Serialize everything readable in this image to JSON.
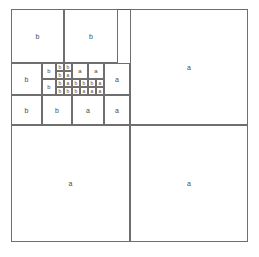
{
  "figure": {
    "background_color": "#ffffff",
    "line_color": "#6f6f6f",
    "outer_line_color": "#5a5a5a",
    "label_color": "#4a4a4a",
    "canvas": {
      "width": 259,
      "height": 257
    }
  },
  "outer_frame": {
    "x": 11,
    "y": 9,
    "width": 237,
    "height": 233
  },
  "labels": {
    "a": "a",
    "b": "b"
  },
  "cells": [
    {
      "name": "top-left-b-1",
      "label": "b",
      "x": 11,
      "y": 9,
      "w": 53,
      "h": 54,
      "font": 7
    },
    {
      "name": "top-left-b-2",
      "label": "b",
      "x": 64,
      "y": 9,
      "w": 54,
      "h": 54,
      "font": 7
    },
    {
      "name": "top-right-a-large",
      "label": "a",
      "x": 130,
      "y": 9,
      "w": 118,
      "h": 116,
      "font": 7
    },
    {
      "name": "mid-left-b",
      "label": "b",
      "x": 11,
      "y": 63,
      "w": 31,
      "h": 32,
      "font": 7
    },
    {
      "name": "mid-b-upper",
      "label": "b",
      "x": 42,
      "y": 63,
      "w": 14,
      "h": 16,
      "font": 6
    },
    {
      "name": "mid-b-lower",
      "label": "b",
      "x": 42,
      "y": 79,
      "w": 14,
      "h": 16,
      "font": 6
    },
    {
      "name": "core-r1-b-1",
      "label": "b",
      "x": 56,
      "y": 63,
      "w": 8,
      "h": 8,
      "font": 5
    },
    {
      "name": "core-r1-b-2",
      "label": "b",
      "x": 64,
      "y": 63,
      "w": 8,
      "h": 8,
      "font": 5
    },
    {
      "name": "core-r2-b-1",
      "label": "b",
      "x": 56,
      "y": 71,
      "w": 8,
      "h": 8,
      "font": 5
    },
    {
      "name": "core-r2-a-1",
      "label": "a",
      "x": 64,
      "y": 71,
      "w": 8,
      "h": 8,
      "font": 5
    },
    {
      "name": "core-top-a-1",
      "label": "a",
      "x": 72,
      "y": 63,
      "w": 16,
      "h": 16,
      "font": 6
    },
    {
      "name": "core-top-a-2",
      "label": "a",
      "x": 88,
      "y": 63,
      "w": 16,
      "h": 16,
      "font": 6
    },
    {
      "name": "core-r3-b-1",
      "label": "b",
      "x": 56,
      "y": 79,
      "w": 8,
      "h": 8,
      "font": 5
    },
    {
      "name": "core-r3-a-1",
      "label": "a",
      "x": 64,
      "y": 79,
      "w": 8,
      "h": 8,
      "font": 5
    },
    {
      "name": "core-r3-b-2",
      "label": "b",
      "x": 72,
      "y": 79,
      "w": 8,
      "h": 8,
      "font": 5
    },
    {
      "name": "core-r3-b-3",
      "label": "b",
      "x": 80,
      "y": 79,
      "w": 8,
      "h": 8,
      "font": 5
    },
    {
      "name": "core-r3-b-4",
      "label": "b",
      "x": 88,
      "y": 79,
      "w": 8,
      "h": 8,
      "font": 5
    },
    {
      "name": "core-r3-a-2",
      "label": "a",
      "x": 96,
      "y": 79,
      "w": 8,
      "h": 8,
      "font": 5
    },
    {
      "name": "core-r4-b-1",
      "label": "b",
      "x": 56,
      "y": 87,
      "w": 8,
      "h": 8,
      "font": 5
    },
    {
      "name": "core-r4-b-2",
      "label": "b",
      "x": 64,
      "y": 87,
      "w": 8,
      "h": 8,
      "font": 5
    },
    {
      "name": "core-r4-b-3",
      "label": "b",
      "x": 72,
      "y": 87,
      "w": 8,
      "h": 8,
      "font": 5
    },
    {
      "name": "core-r4-a-1",
      "label": "a",
      "x": 80,
      "y": 87,
      "w": 8,
      "h": 8,
      "font": 5
    },
    {
      "name": "core-r4-a-2",
      "label": "a",
      "x": 88,
      "y": 87,
      "w": 8,
      "h": 8,
      "font": 5
    },
    {
      "name": "core-r4-a-3",
      "label": "a",
      "x": 96,
      "y": 87,
      "w": 8,
      "h": 8,
      "font": 5
    },
    {
      "name": "mid-right-a",
      "label": "a",
      "x": 104,
      "y": 63,
      "w": 26,
      "h": 32,
      "font": 7
    },
    {
      "name": "bottom-band-b-1",
      "label": "b",
      "x": 11,
      "y": 95,
      "w": 31,
      "h": 30,
      "font": 7
    },
    {
      "name": "bottom-band-b-2",
      "label": "b",
      "x": 42,
      "y": 95,
      "w": 30,
      "h": 30,
      "font": 7
    },
    {
      "name": "bottom-band-a-1",
      "label": "a",
      "x": 72,
      "y": 95,
      "w": 32,
      "h": 30,
      "font": 7
    },
    {
      "name": "bottom-band-a-2",
      "label": "a",
      "x": 104,
      "y": 95,
      "w": 26,
      "h": 30,
      "font": 7
    },
    {
      "name": "bottom-left-a",
      "label": "a",
      "x": 11,
      "y": 125,
      "w": 119,
      "h": 117,
      "font": 7
    },
    {
      "name": "bottom-right-a",
      "label": "a",
      "x": 130,
      "y": 125,
      "w": 118,
      "h": 117,
      "font": 7
    }
  ]
}
